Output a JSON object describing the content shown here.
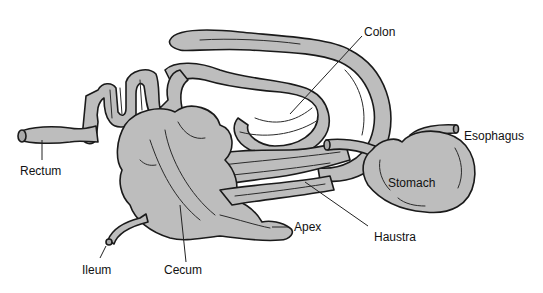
{
  "diagram": {
    "background": "#ffffff",
    "organ_fill": "#bdbdbd",
    "outline_color": "#1a1a1a",
    "labels": {
      "colon": "Colon",
      "esophagus": "Esophagus",
      "rectum": "Rectum",
      "stomach": "Stomach",
      "apex": "Apex",
      "haustra": "Haustra",
      "ileum": "Ileum",
      "cecum": "Cecum"
    },
    "structures": [
      "rectum",
      "colon",
      "stomach",
      "esophagus",
      "cecum",
      "apex",
      "ileum",
      "haustra"
    ]
  }
}
